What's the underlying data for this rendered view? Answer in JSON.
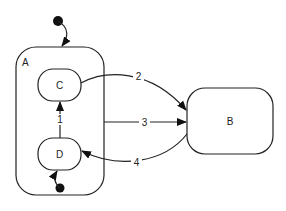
{
  "diagram": {
    "type": "state-machine",
    "states": [
      {
        "id": "A",
        "label": "A",
        "kind": "composite"
      },
      {
        "id": "C",
        "label": "C",
        "parent": "A"
      },
      {
        "id": "D",
        "label": "D",
        "parent": "A"
      },
      {
        "id": "B",
        "label": "B"
      }
    ],
    "initial_states": [
      {
        "target": "A"
      },
      {
        "target": "D",
        "parent": "A"
      }
    ],
    "transitions": [
      {
        "label": "1",
        "from": "D",
        "to": "C"
      },
      {
        "label": "2",
        "from": "C",
        "to": "B"
      },
      {
        "label": "3",
        "from": "A",
        "to": "B"
      },
      {
        "label": "4",
        "from": "B",
        "to": "D"
      }
    ],
    "colors": {
      "stroke": "#222222",
      "background": "#ffffff"
    }
  }
}
